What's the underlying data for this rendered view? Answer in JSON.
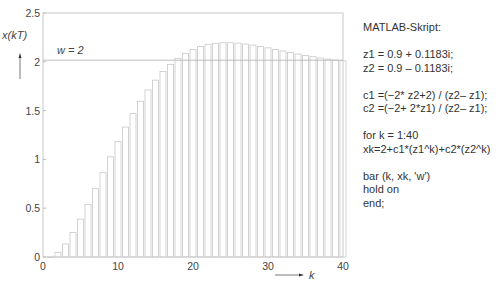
{
  "chart_data": {
    "type": "bar",
    "title": "",
    "xlabel": "k",
    "ylabel": "x(kT)",
    "xlim": [
      0,
      40
    ],
    "ylim": [
      0,
      2.5
    ],
    "xticks": [
      0,
      10,
      20,
      30,
      40
    ],
    "yticks": [
      0,
      0.5,
      1,
      1.5,
      2,
      2.5
    ],
    "ytick_labels": [
      "0",
      "0.5",
      "1",
      "1.5",
      "2",
      "2.5"
    ],
    "grid": false,
    "bar_color": "#ffffff",
    "bar_edge": "#c8c8c8",
    "reference_line": {
      "y": 2,
      "label": "w = 2"
    },
    "categories": [
      1,
      2,
      3,
      4,
      5,
      6,
      7,
      8,
      9,
      10,
      11,
      12,
      13,
      14,
      15,
      16,
      17,
      18,
      19,
      20,
      21,
      22,
      23,
      24,
      25,
      26,
      27,
      28,
      29,
      30,
      31,
      32,
      33,
      34,
      35,
      36,
      37,
      38,
      39,
      40
    ],
    "values": [
      0.0,
      0.048,
      0.134,
      0.25,
      0.388,
      0.54,
      0.7,
      0.864,
      1.026,
      1.182,
      1.331,
      1.469,
      1.596,
      1.711,
      1.812,
      1.9,
      1.974,
      2.036,
      2.087,
      2.127,
      2.156,
      2.176,
      2.189,
      2.195,
      2.195,
      2.191,
      2.182,
      2.171,
      2.158,
      2.143,
      2.127,
      2.111,
      2.095,
      2.08,
      2.065,
      2.052,
      2.039,
      2.028,
      2.018,
      2.01
    ]
  },
  "script": {
    "heading": "MATLAB-Skript:",
    "lines": [
      "z1 = 0.9 + 0.1183i;",
      "z2 = 0.9 – 0.1183i;",
      "",
      "c1 =(−2* z2+2) / (z2– z1);",
      "c2 =(−2+ 2*z1) / (z2– z1);",
      "",
      "for k = 1:40",
      "xk=2+c1*(z1^k)+c2*(z2^k)",
      "",
      "bar (k, xk, 'w')",
      "hold on",
      "end;"
    ]
  }
}
